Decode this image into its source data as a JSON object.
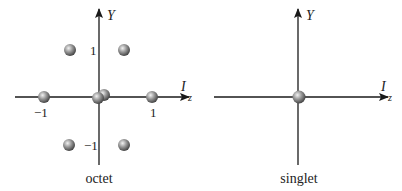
{
  "diagrams": [
    {
      "name": "octet",
      "caption": "octet",
      "y_axis_label": "Y",
      "x_axis_label": "I",
      "x_axis_subscript": "z",
      "tick_labels": {
        "y_pos": "1",
        "y_neg": "−1",
        "x_pos": "1",
        "x_neg": "−1"
      },
      "points": [
        {
          "Iz": -0.5,
          "Y": 1
        },
        {
          "Iz": 0.5,
          "Y": 1
        },
        {
          "Iz": -1,
          "Y": 0
        },
        {
          "Iz": 0,
          "Y": 0
        },
        {
          "Iz": 0,
          "Y": 0
        },
        {
          "Iz": 1,
          "Y": 0
        },
        {
          "Iz": -0.5,
          "Y": -1
        },
        {
          "Iz": 0.5,
          "Y": -1
        }
      ]
    },
    {
      "name": "singlet",
      "caption": "singlet",
      "y_axis_label": "Y",
      "x_axis_label": "I",
      "x_axis_subscript": "z",
      "points": [
        {
          "Iz": 0,
          "Y": 0
        }
      ]
    }
  ],
  "colors": {
    "axis": "#1a1a1a",
    "ball_light": "#e8e8e8",
    "ball_mid": "#8a8a8a",
    "ball_dark": "#3a3a3a"
  }
}
